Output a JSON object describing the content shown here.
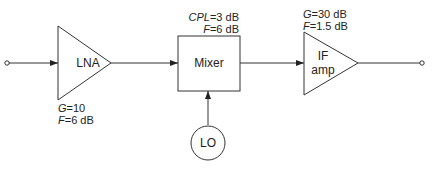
{
  "diagram": {
    "title": "",
    "nodes": [
      {
        "id": "input",
        "type": "terminal"
      },
      {
        "id": "lna",
        "type": "amplifier",
        "label": "LNA",
        "params": [
          {
            "sym": "G",
            "value": "=10"
          },
          {
            "sym": "F",
            "value": "=6 dB"
          }
        ]
      },
      {
        "id": "mixer",
        "type": "box",
        "label": "Mixer",
        "params": [
          {
            "sym": "CPL",
            "value": "=3 dB"
          },
          {
            "sym": "F",
            "value": "=6 dB"
          }
        ]
      },
      {
        "id": "lo",
        "type": "circle",
        "label": "LO"
      },
      {
        "id": "if_amp",
        "type": "amplifier",
        "label_line1": "IF",
        "label_line2": "amp",
        "params": [
          {
            "sym": "G",
            "value": "=30 dB"
          },
          {
            "sym": "F",
            "value": "=1.5 dB"
          }
        ]
      },
      {
        "id": "output",
        "type": "terminal"
      }
    ],
    "edges": [
      {
        "from": "input",
        "to": "lna"
      },
      {
        "from": "lna",
        "to": "mixer"
      },
      {
        "from": "lo",
        "to": "mixer"
      },
      {
        "from": "mixer",
        "to": "if_amp"
      },
      {
        "from": "if_amp",
        "to": "output"
      }
    ],
    "colors": {
      "stroke": "#333333",
      "background": "#ffffff"
    }
  }
}
